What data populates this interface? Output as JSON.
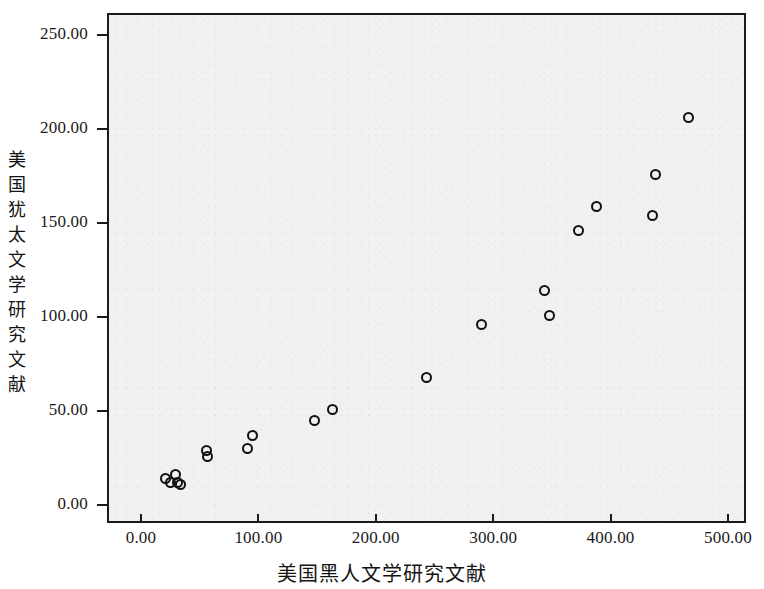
{
  "chart": {
    "type": "scatter",
    "title": "",
    "xlabel": "美国黑人文学研究文献",
    "ylabel": "美国犹太文学研究文献",
    "marker": "open-circle",
    "marker_color": "#111111",
    "plot_background": "#f1f1ef",
    "frame_color": "#1b1b1b",
    "grid": "off",
    "legend": "none"
  },
  "axes": {
    "x": {
      "min": 0,
      "max": 500,
      "tick_step": 100,
      "ticks": [
        0,
        100,
        200,
        300,
        400,
        500
      ],
      "tick_labels": [
        "0.00",
        "100.00",
        "200.00",
        "300.00",
        "400.00",
        "500.00"
      ]
    },
    "y": {
      "min": 0,
      "max": 250,
      "tick_step": 50,
      "ticks": [
        0,
        50,
        100,
        150,
        200,
        250
      ],
      "tick_labels": [
        "0.00",
        "50.00",
        "100.00",
        "150.00",
        "200.00",
        "250.00"
      ]
    }
  },
  "chart_data": {
    "type": "scatter",
    "title": "",
    "xlabel": "美国黑人文学研究文献",
    "ylabel": "美国犹太文学研究文献",
    "xlim": [
      0,
      500
    ],
    "ylim": [
      0,
      250
    ],
    "xticks": [
      0,
      100,
      200,
      300,
      400,
      500
    ],
    "yticks": [
      0,
      50,
      100,
      150,
      200,
      250
    ],
    "xtick_labels": [
      "0.00",
      "100.00",
      "200.00",
      "300.00",
      "400.00",
      "500.00"
    ],
    "ytick_labels": [
      "0.00",
      "50.00",
      "100.00",
      "150.00",
      "200.00",
      "250.00"
    ],
    "grid": false,
    "legend": null,
    "series": [
      {
        "name": "文献对照",
        "marker": "o",
        "filled": false,
        "color": "#111111",
        "points": [
          {
            "x": 21,
            "y": 14
          },
          {
            "x": 25,
            "y": 12
          },
          {
            "x": 29,
            "y": 16
          },
          {
            "x": 31,
            "y": 12
          },
          {
            "x": 34,
            "y": 11
          },
          {
            "x": 56,
            "y": 29
          },
          {
            "x": 57,
            "y": 26
          },
          {
            "x": 91,
            "y": 30
          },
          {
            "x": 95,
            "y": 37
          },
          {
            "x": 148,
            "y": 45
          },
          {
            "x": 163,
            "y": 51
          },
          {
            "x": 243,
            "y": 68
          },
          {
            "x": 290,
            "y": 96
          },
          {
            "x": 344,
            "y": 114
          },
          {
            "x": 348,
            "y": 101
          },
          {
            "x": 373,
            "y": 146
          },
          {
            "x": 388,
            "y": 159
          },
          {
            "x": 436,
            "y": 154
          },
          {
            "x": 438,
            "y": 176
          },
          {
            "x": 466,
            "y": 206
          }
        ]
      }
    ],
    "n_points": 20
  }
}
